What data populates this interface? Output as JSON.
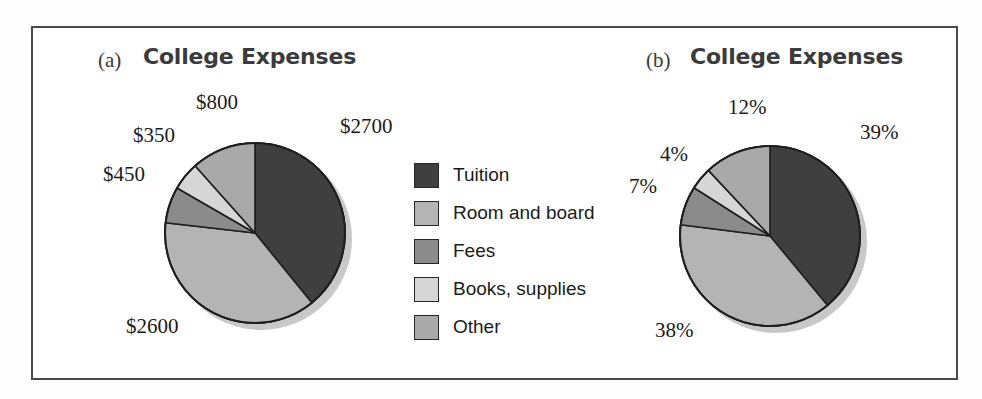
{
  "figure": {
    "background_color": "#ffffff",
    "frame_color": "#4a4a4a"
  },
  "panels": [
    {
      "tag": "(a)",
      "title": "College Expenses"
    },
    {
      "tag": "(b)",
      "title": "College Expenses"
    }
  ],
  "legend": {
    "items": [
      {
        "label": "Tuition",
        "color": "#3f3f3f"
      },
      {
        "label": "Room and board",
        "color": "#b4b4b4"
      },
      {
        "label": "Fees",
        "color": "#8b8b8b"
      },
      {
        "label": "Books, supplies",
        "color": "#d6d6d6"
      },
      {
        "label": "Other",
        "color": "#a9a9a9"
      }
    ]
  },
  "chart_data": [
    {
      "type": "pie",
      "title": "College Expenses",
      "panel": "(a)",
      "categories": [
        "Tuition",
        "Room and board",
        "Fees",
        "Books, supplies",
        "Other"
      ],
      "values": [
        2700,
        2600,
        450,
        350,
        800
      ],
      "value_labels": [
        "$2700",
        "$2600",
        "$450",
        "$350",
        "$800"
      ],
      "colors": [
        "#3f3f3f",
        "#b4b4b4",
        "#8b8b8b",
        "#d6d6d6",
        "#a9a9a9"
      ],
      "unit": "dollars",
      "total": 6900,
      "start_angle_deg": 0,
      "direction": "clockwise",
      "legend_position": "center-right",
      "grid": false
    },
    {
      "type": "pie",
      "title": "College Expenses",
      "panel": "(b)",
      "categories": [
        "Tuition",
        "Room and board",
        "Fees",
        "Books, supplies",
        "Other"
      ],
      "values": [
        39,
        38,
        7,
        4,
        12
      ],
      "value_labels": [
        "39%",
        "38%",
        "7%",
        "4%",
        "12%"
      ],
      "colors": [
        "#3f3f3f",
        "#b4b4b4",
        "#8b8b8b",
        "#d6d6d6",
        "#a9a9a9"
      ],
      "unit": "percent",
      "total": 100,
      "start_angle_deg": 0,
      "direction": "clockwise",
      "legend_position": "center-right",
      "grid": false
    }
  ],
  "labels_a": [
    {
      "text": "$800",
      "left": 196,
      "top": 90
    },
    {
      "text": "$2700",
      "left": 340,
      "top": 114
    },
    {
      "text": "$350",
      "left": 133,
      "top": 123
    },
    {
      "text": "$450",
      "left": 103,
      "top": 162
    },
    {
      "text": "$2600",
      "left": 126,
      "top": 314
    }
  ],
  "labels_b": [
    {
      "text": "12%",
      "left": 728,
      "top": 95
    },
    {
      "text": "39%",
      "left": 860,
      "top": 120
    },
    {
      "text": "4%",
      "left": 660,
      "top": 142
    },
    {
      "text": "7%",
      "left": 629,
      "top": 174
    },
    {
      "text": "38%",
      "left": 655,
      "top": 318
    }
  ]
}
